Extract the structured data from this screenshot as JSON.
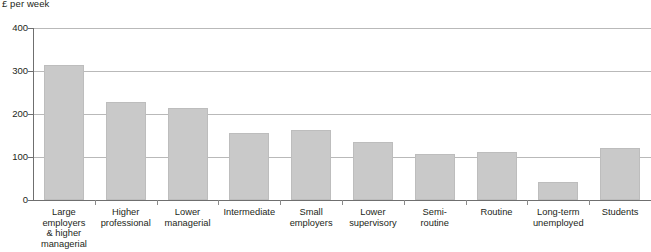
{
  "chart_data": {
    "type": "bar",
    "title": "",
    "subtitle": "",
    "xlabel": "",
    "ylabel": "£ per week",
    "ylim": [
      0,
      400
    ],
    "yticks": [
      0,
      100,
      200,
      300,
      400
    ],
    "ytick_labels": [
      "0",
      "100",
      "200",
      "300",
      "400"
    ],
    "grid": true,
    "legend": false,
    "categories": [
      "Large\nemployers\n& higher\nmanagerial",
      "Higher\nprofessional",
      "Lower\nmanagerial",
      "Intermediate",
      "Small\nemployers",
      "Lower\nsupervisory",
      "Semi-\nroutine",
      "Routine",
      "Long-term\nunemployed",
      "Students"
    ],
    "values": [
      315,
      227,
      213,
      157,
      163,
      134,
      107,
      112,
      42,
      120
    ],
    "bar_color": "#c9c9c9",
    "bar_edge_color": "#bdbdbd",
    "gridline_color": "#b9b9b9",
    "axis_color": "#6f6f6f"
  },
  "axis": {
    "unit_caption": "£ per week"
  }
}
